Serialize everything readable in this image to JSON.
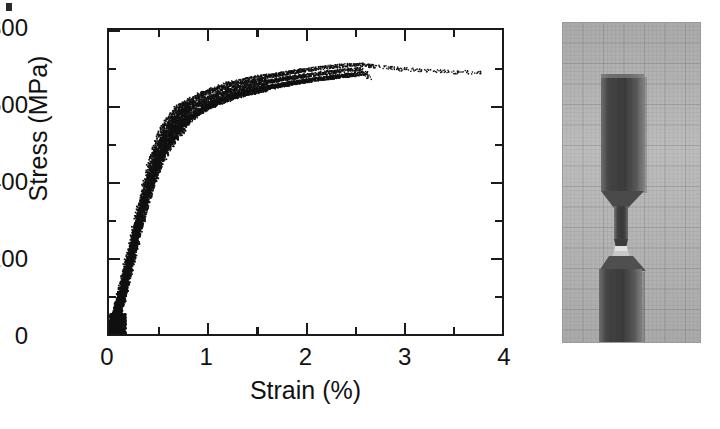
{
  "figure": {
    "type": "stress-strain-figure",
    "panels": [
      "stress-strain-chart",
      "fractured-specimen-photograph"
    ]
  },
  "chart_data": {
    "type": "scatter",
    "title": "",
    "subtitle": "",
    "xlabel": "Strain (%)",
    "ylabel": "Stress (MPa)",
    "xlim": [
      0,
      4
    ],
    "ylim": [
      0,
      800
    ],
    "x_major_ticks": [
      0,
      1,
      2,
      3,
      4
    ],
    "x_minor_ticks": [
      0.5,
      1.5,
      2.5,
      3.5
    ],
    "y_major_ticks": [
      0,
      200,
      400,
      600,
      800
    ],
    "y_minor_ticks": [
      100,
      300,
      500,
      700
    ],
    "x_tick_labels": [
      "0",
      "1",
      "2",
      "3",
      "4"
    ],
    "y_tick_labels": [
      "0",
      "200",
      "400",
      "600",
      "800"
    ],
    "grid": false,
    "legend": null,
    "legend_position": "none",
    "annotations": [],
    "marker_color": "#111111",
    "series": [
      {
        "name": "Specimen 1",
        "x": [
          0.0,
          0.04,
          0.08,
          0.12,
          0.16,
          0.2,
          0.24,
          0.28,
          0.32,
          0.36,
          0.4,
          0.45,
          0.5,
          0.55,
          0.6,
          0.65,
          0.7,
          0.8,
          0.9,
          1.0,
          1.2,
          1.4,
          1.6,
          1.8,
          2.0,
          2.2,
          2.4,
          2.55,
          2.7,
          2.9,
          3.1,
          3.3,
          3.5,
          3.7,
          3.8
        ],
        "y": [
          0,
          30,
          70,
          115,
          160,
          205,
          250,
          295,
          340,
          385,
          425,
          470,
          505,
          530,
          552,
          570,
          585,
          605,
          620,
          632,
          650,
          663,
          673,
          682,
          690,
          697,
          702,
          705,
          700,
          694,
          690,
          687,
          685,
          684,
          684
        ]
      },
      {
        "name": "Specimen 2",
        "x": [
          0.0,
          0.04,
          0.08,
          0.12,
          0.16,
          0.2,
          0.24,
          0.28,
          0.32,
          0.36,
          0.4,
          0.45,
          0.5,
          0.55,
          0.6,
          0.65,
          0.7,
          0.8,
          0.9,
          1.0,
          1.2,
          1.4,
          1.6,
          1.8,
          2.0,
          2.2,
          2.4,
          2.55,
          2.65
        ],
        "y": [
          0,
          26,
          62,
          104,
          148,
          192,
          236,
          280,
          322,
          364,
          402,
          446,
          482,
          510,
          534,
          552,
          568,
          590,
          606,
          618,
          638,
          652,
          663,
          672,
          680,
          687,
          693,
          697,
          672
        ]
      },
      {
        "name": "Specimen 3",
        "x": [
          0.0,
          0.04,
          0.08,
          0.12,
          0.16,
          0.2,
          0.24,
          0.28,
          0.32,
          0.36,
          0.4,
          0.45,
          0.5,
          0.55,
          0.6,
          0.65,
          0.7,
          0.8,
          0.9,
          1.0,
          1.2,
          1.4,
          1.6,
          1.8,
          2.0,
          2.2,
          2.4,
          2.5
        ],
        "y": [
          0,
          22,
          54,
          92,
          134,
          176,
          218,
          260,
          302,
          344,
          382,
          424,
          460,
          488,
          512,
          532,
          548,
          572,
          590,
          604,
          626,
          641,
          652,
          662,
          670,
          677,
          683,
          686
        ]
      },
      {
        "name": "Specimen 4",
        "x": [
          0.0,
          0.05,
          0.1,
          0.15,
          0.2,
          0.25,
          0.3,
          0.35,
          0.4,
          0.45,
          0.5,
          0.55,
          0.6,
          0.7,
          0.8,
          1.0,
          1.3,
          1.6,
          1.9,
          2.2,
          2.45,
          2.6
        ],
        "y": [
          0,
          34,
          84,
          136,
          188,
          240,
          290,
          338,
          382,
          422,
          456,
          484,
          508,
          544,
          572,
          608,
          636,
          655,
          670,
          682,
          690,
          694
        ]
      }
    ]
  },
  "photo": {
    "caption": "",
    "subject": "fractured-tensile-specimen",
    "description": "Fractured dogbone tensile test specimen photographed on gridded graph paper",
    "background": "graph-paper",
    "specimen_color": "#4e4e4e",
    "paper_color": "#b9b9b9"
  },
  "artifacts": {
    "corner_mark": "page-scan-speck"
  }
}
